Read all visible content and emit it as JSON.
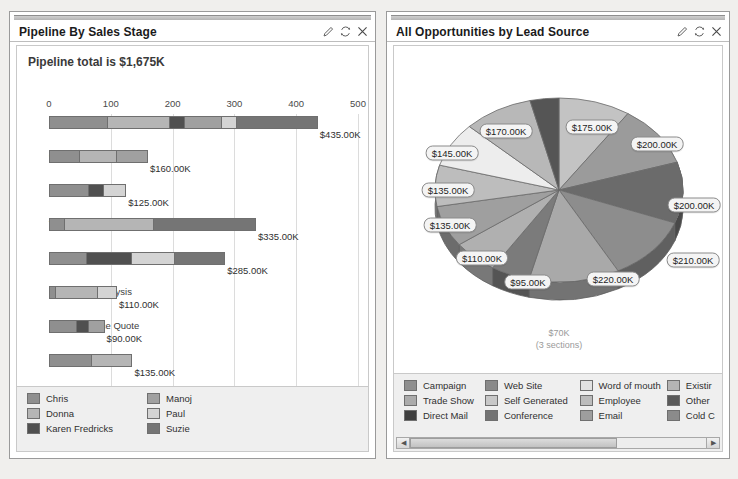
{
  "panels": {
    "pipeline": {
      "title": "Pipeline By Sales Stage",
      "headline": "Pipeline total is $1,675K",
      "footer_note": "Opportunity size in $1K",
      "tools": {
        "edit": "edit-pencil-icon",
        "refresh": "refresh-icon",
        "close": "close-icon"
      }
    },
    "leadsource": {
      "title": "All Opportunities by Lead Source",
      "tools": {
        "edit": "edit-pencil-icon",
        "refresh": "refresh-icon",
        "close": "close-icon"
      },
      "small_label_line1": "$70K",
      "small_label_line2": "(3 sections)"
    }
  },
  "chart_data": [
    {
      "type": "bar",
      "orientation": "horizontal",
      "stacked": true,
      "title": "Pipeline By Sales Stage",
      "subtitle": "Pipeline total is $1,675K",
      "xlabel": "Opportunity size in $1K",
      "ylabel": "",
      "xlim": [
        0,
        500
      ],
      "xticks": [
        0,
        100,
        200,
        300,
        400,
        500
      ],
      "grid": true,
      "legend_position": "bottom",
      "categories": [
        "Prospecting",
        "Qualification",
        "Needs Analysis",
        "Value Proposition",
        "Id. Decision Makers",
        "Perception Analysis",
        "Proposal/Price Quote",
        "Negotiation/Review"
      ],
      "values": [
        435,
        160,
        125,
        335,
        285,
        110,
        90,
        135
      ],
      "value_labels": [
        "$435.00K",
        "$160.00K",
        "$125.00K",
        "$335.00K",
        "$285.00K",
        "$110.00K",
        "$90.00K",
        "$135.00K"
      ],
      "series": [
        {
          "name": "Chris",
          "color": "#8f8f8f",
          "values": [
            95,
            50,
            65,
            25,
            60,
            10,
            45,
            70
          ]
        },
        {
          "name": "Donna",
          "color": "#b5b5b5",
          "values": [
            100,
            60,
            0,
            145,
            0,
            70,
            0,
            65
          ]
        },
        {
          "name": "Karen Fredricks",
          "color": "#505050",
          "values": [
            25,
            0,
            25,
            0,
            75,
            0,
            20,
            0
          ]
        },
        {
          "name": "Manoj",
          "color": "#a0a0a0",
          "values": [
            60,
            50,
            0,
            0,
            0,
            0,
            25,
            0
          ]
        },
        {
          "name": "Paul",
          "color": "#d4d4d4",
          "values": [
            25,
            0,
            35,
            0,
            70,
            30,
            0,
            0
          ]
        },
        {
          "name": "Suzie",
          "color": "#757575",
          "values": [
            130,
            0,
            0,
            165,
            80,
            0,
            0,
            0
          ]
        }
      ],
      "legend": [
        {
          "label": "Chris",
          "color": "#8f8f8f"
        },
        {
          "label": "Donna",
          "color": "#b5b5b5"
        },
        {
          "label": "Karen Fredricks",
          "color": "#505050"
        },
        {
          "label": "Manoj",
          "color": "#a0a0a0"
        },
        {
          "label": "Paul",
          "color": "#d4d4d4"
        },
        {
          "label": "Suzie",
          "color": "#757575"
        }
      ]
    },
    {
      "type": "pie",
      "title": "All Opportunities by Lead Source",
      "grid": false,
      "legend_position": "bottom",
      "total_label": "$70K",
      "grouped_label": "(3 sections)",
      "slices": [
        {
          "label": "$175.00K",
          "value": 175,
          "color": "#c3c3c3"
        },
        {
          "label": "$200.00K",
          "value": 200,
          "color": "#9b9b9b"
        },
        {
          "label": "$200.00K",
          "value": 200,
          "color": "#6b6b6b"
        },
        {
          "label": "$210.00K",
          "value": 210,
          "color": "#8d8d8d"
        },
        {
          "label": "$220.00K",
          "value": 220,
          "color": "#a9a9a9"
        },
        {
          "label": "$95.00K",
          "value": 95,
          "color": "#7b7b7b"
        },
        {
          "label": "$110.00K",
          "value": 110,
          "color": "#b0b0b0"
        },
        {
          "label": "$135.00K",
          "value": 135,
          "color": "#9f9f9f"
        },
        {
          "label": "$135.00K",
          "value": 135,
          "color": "#bdbdbd"
        },
        {
          "label": "$145.00K",
          "value": 145,
          "color": "#ededed"
        },
        {
          "label": "$170.00K",
          "value": 170,
          "color": "#b8b8b8"
        },
        {
          "label": "$70K",
          "value": 70,
          "color": "#555555"
        }
      ],
      "legend": [
        {
          "label": "Campaign",
          "color": "#8f8f8f"
        },
        {
          "label": "Trade Show",
          "color": "#ababab"
        },
        {
          "label": "Direct Mail",
          "color": "#3f3f3f"
        },
        {
          "label": "Web Site",
          "color": "#8a8a8a"
        },
        {
          "label": "Self Generated",
          "color": "#c8c8c8"
        },
        {
          "label": "Conference",
          "color": "#737373"
        },
        {
          "label": "Word of mouth",
          "color": "#e2e2e2"
        },
        {
          "label": "Employee",
          "color": "#bcbcbc"
        },
        {
          "label": "Email",
          "color": "#9e9e9e"
        },
        {
          "label": "Existir",
          "color": "#b4b4b4"
        },
        {
          "label": "Other",
          "color": "#5a5a5a"
        },
        {
          "label": "Cold C",
          "color": "#8b8b8b"
        }
      ]
    }
  ]
}
